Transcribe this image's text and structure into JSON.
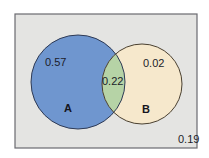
{
  "diagram": {
    "type": "venn",
    "universe": {
      "outside_probability": "0.19",
      "fill": "#e4e4e2",
      "border": "#6a6a70"
    },
    "sets": [
      {
        "name": "A",
        "only_probability": "0.57",
        "fill": "#6f96cf",
        "border": "#2e3a55"
      },
      {
        "name": "B",
        "only_probability": "0.02",
        "fill": "#f6e8cc",
        "border": "#4a4030"
      }
    ],
    "intersection": {
      "label": "0.22",
      "fill": "#b6d3a6"
    }
  }
}
